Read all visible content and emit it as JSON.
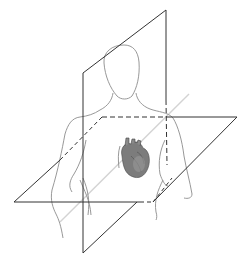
{
  "diagram": {
    "elements": [
      {
        "id": "body-outline",
        "label": "Human torso outline",
        "color": "#8a8a8a"
      },
      {
        "id": "sagittal-plane",
        "label": "Vertical (sagittal) plane",
        "color": "#333333"
      },
      {
        "id": "transverse-plane",
        "label": "Horizontal (transverse) plane",
        "color": "#333333"
      },
      {
        "id": "axis-line",
        "label": "Oblique axis line",
        "color": "#d4d4d4"
      },
      {
        "id": "heart",
        "label": "Heart",
        "color": "#6e6e6e"
      }
    ],
    "colors": {
      "background": "#ffffff",
      "plane_stroke": "#333333",
      "body_stroke": "#8a8a8a",
      "axis_stroke": "#d0d0d0",
      "heart_fill": "#7a7a7a",
      "heart_shade": "#4a4a4a"
    }
  }
}
